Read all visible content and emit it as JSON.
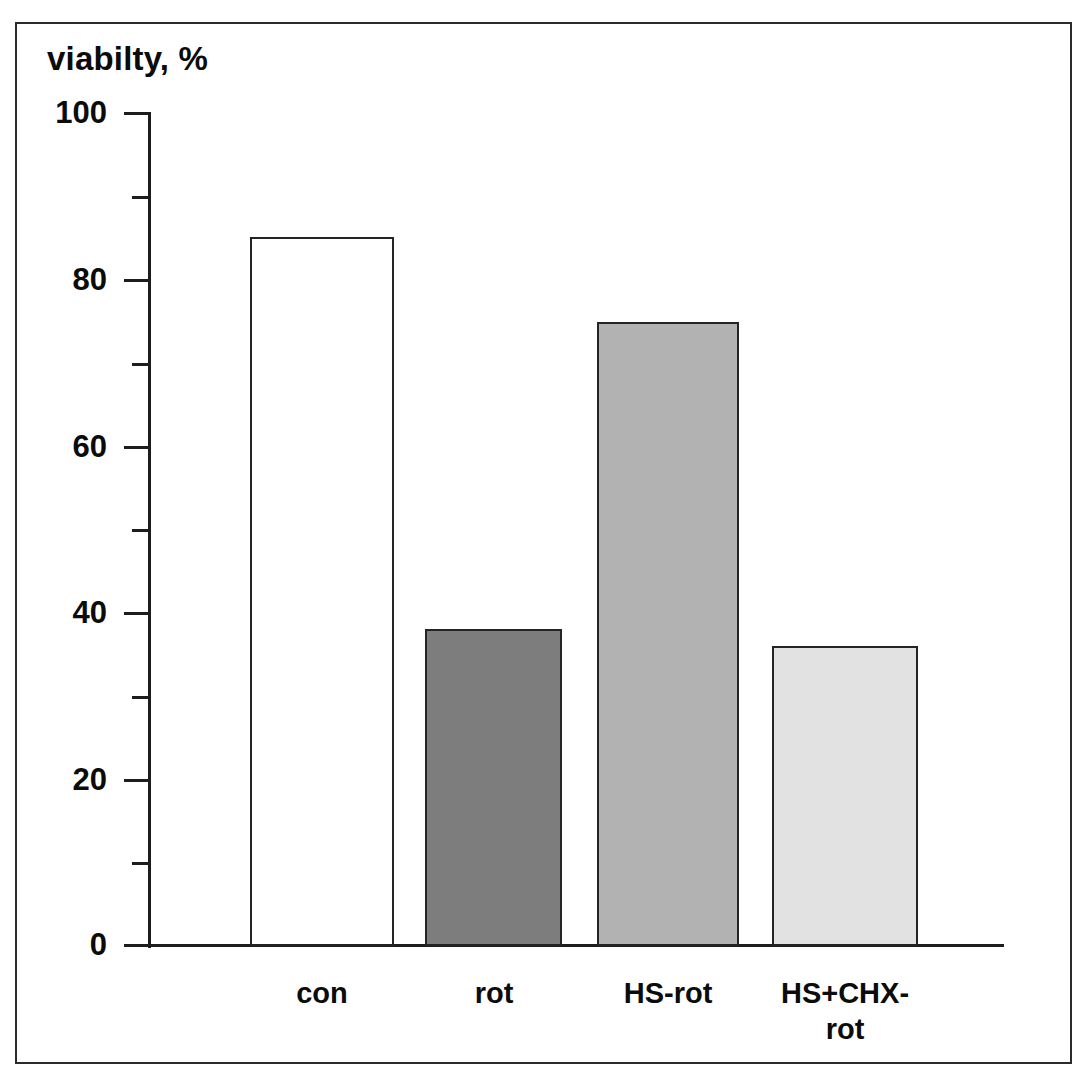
{
  "chart_data": {
    "type": "bar",
    "title": "viabilty, %",
    "xlabel": "",
    "ylabel": "viabilty, %",
    "categories": [
      "con",
      "rot",
      "HS-rot",
      "HS+CHX-\nrot"
    ],
    "values": [
      85,
      38,
      74.8,
      36
    ],
    "ylim": [
      0,
      100
    ],
    "y_ticks_major": [
      0,
      20,
      40,
      60,
      80,
      100
    ],
    "y_ticks_minor": [
      10,
      30,
      50,
      70,
      90
    ],
    "y_tick_labels": [
      "0",
      "20",
      "40",
      "60",
      "80",
      "100"
    ],
    "grid": false,
    "legend": null,
    "bar_colors": [
      "#ffffff",
      "#7d7d7d",
      "#b2b2b2",
      "#e2e2e2"
    ],
    "bar_edge_color": "#242424",
    "axis_color": "#1d1d1d",
    "background_color": "#ffffff",
    "frame_color": "#2b2b2b",
    "series": [
      {
        "name": "viability",
        "points": [
          {
            "category": "con",
            "value": 85,
            "color": "#ffffff"
          },
          {
            "category": "rot",
            "value": 38,
            "color": "#7d7d7d"
          },
          {
            "category": "HS-rot",
            "value": 74.8,
            "color": "#b2b2b2"
          },
          {
            "category": "HS+CHX-rot",
            "value": 36,
            "color": "#e2e2e2"
          }
        ]
      }
    ]
  }
}
